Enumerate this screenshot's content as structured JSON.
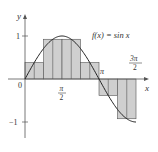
{
  "chart_data": {
    "type": "bar",
    "title": "f(x) = sin x",
    "function": "sin x",
    "xlabel": "x",
    "ylabel": "y",
    "xlim": [
      0,
      4.712
    ],
    "ylim": [
      -1,
      1
    ],
    "x_ticks": [
      {
        "value": 0,
        "label": "0"
      },
      {
        "value": 1.5708,
        "label_num": "π",
        "label_den": "2"
      },
      {
        "value": 3.1416,
        "label": "π"
      },
      {
        "value": 4.7124,
        "label_num": "3π",
        "label_den": "2"
      }
    ],
    "y_ticks": [
      {
        "value": 1,
        "label": "1"
      },
      {
        "value": -1,
        "label": "−1"
      }
    ],
    "rectangle_method": "midpoint",
    "rectangle_width": "π/4",
    "rectangles": [
      {
        "x0": 0,
        "x1": 0.7854,
        "height": 0.383
      },
      {
        "x0": 0.7854,
        "x1": 1.5708,
        "height": 0.924
      },
      {
        "x0": 1.5708,
        "x1": 2.3562,
        "height": 0.924
      },
      {
        "x0": 2.3562,
        "x1": 3.1416,
        "height": 0.383
      },
      {
        "x0": 3.1416,
        "x1": 3.927,
        "height": -0.383
      },
      {
        "x0": 3.927,
        "x1": 4.7124,
        "height": -0.924
      }
    ],
    "subdivision_lines_every": "π/8",
    "grid": false,
    "colors": {
      "fill": "#cfcfcf",
      "stroke": "#555555",
      "curve": "#222222",
      "axis": "#555555"
    }
  },
  "labels": {
    "function_label": "f(x) = sin x",
    "y_axis": "y",
    "x_axis": "x",
    "origin": "0",
    "y_one": "1",
    "y_neg_one": "−1",
    "pi": "π",
    "pi_half_num": "π",
    "pi_half_den": "2",
    "three_pi_half_num": "3π",
    "three_pi_half_den": "2"
  }
}
